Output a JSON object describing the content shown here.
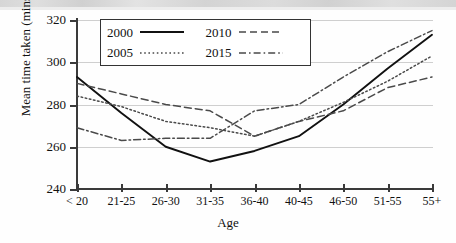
{
  "chart_data": {
    "type": "line",
    "title": "",
    "xlabel": "Age",
    "ylabel": "Mean time taken (mins)",
    "categories": [
      "< 20",
      "21-25",
      "26-30",
      "31-35",
      "36-40",
      "40-45",
      "46-50",
      "51-55",
      "55+"
    ],
    "yticks": [
      240,
      260,
      280,
      300,
      320
    ],
    "ylim": [
      240,
      320
    ],
    "grid": "horizontal",
    "legend_position": "top-center-inside",
    "series": [
      {
        "name": "2000",
        "style": "solid",
        "values": [
          293,
          276,
          260,
          253,
          258,
          265,
          280,
          297,
          313
        ]
      },
      {
        "name": "2005",
        "style": "dotted",
        "values": [
          284,
          279,
          272,
          269,
          265,
          272,
          281,
          291,
          303
        ]
      },
      {
        "name": "2010",
        "style": "dashed",
        "values": [
          290,
          285,
          280,
          277,
          265,
          272,
          277,
          288,
          293
        ]
      },
      {
        "name": "2015",
        "style": "dashdot",
        "values": [
          269,
          263,
          264,
          264,
          277,
          280,
          293,
          305,
          315
        ]
      }
    ],
    "legend_entries": [
      {
        "label": "2000",
        "style": "solid"
      },
      {
        "label": "2010",
        "style": "dashed"
      },
      {
        "label": "2005",
        "style": "dotted"
      },
      {
        "label": "2015",
        "style": "dashdot"
      }
    ]
  }
}
